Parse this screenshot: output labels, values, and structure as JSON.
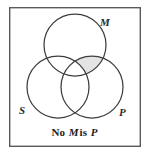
{
  "figure": {
    "type": "venn-diagram",
    "caption_parts": {
      "word1": "No",
      "term_middle": "M",
      "word2": "is",
      "term_predicate": "P"
    },
    "caption_full": "No M is P",
    "frame": {
      "x": 9,
      "y": 7,
      "width": 132,
      "height": 140,
      "stroke": "#5a5a5a",
      "stroke_width": 1.4,
      "fill": "#ffffff"
    },
    "circles": [
      {
        "id": "M",
        "label": "M",
        "cx": 75,
        "cy": 45,
        "r": 31
      },
      {
        "id": "S",
        "label": "S",
        "cx": 58,
        "cy": 87,
        "r": 31
      },
      {
        "id": "P",
        "label": "P",
        "cx": 92,
        "cy": 87,
        "r": 31
      }
    ],
    "labels": {
      "m": "M",
      "s": "S",
      "p": "P"
    },
    "shaded_region": {
      "description": "M intersect P, excluding S",
      "fill": "#e4e4e4"
    },
    "colors": {
      "background": "#ffffff",
      "frame_stroke": "#5a5a5a",
      "circle_stroke": "#3d3d3d",
      "shade_fill": "#e4e4e4",
      "text": "#2b2b2b"
    }
  }
}
